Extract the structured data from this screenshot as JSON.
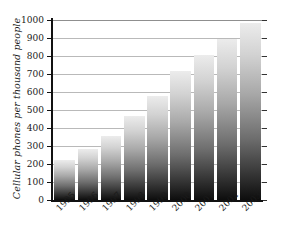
{
  "chart_data": {
    "type": "bar",
    "title": "",
    "subtitle": "",
    "xlabel": "",
    "ylabel": "Cellular phones per thousand people",
    "categories": [
      "1995",
      "1996",
      "1997",
      "1998",
      "1999",
      "2000",
      "2001",
      "2002",
      "2003"
    ],
    "values": [
      225,
      285,
      355,
      465,
      580,
      715,
      805,
      895,
      985
    ],
    "series": [
      {
        "name": "Cellular phones per thousand people",
        "values": [
          225,
          285,
          355,
          465,
          580,
          715,
          805,
          895,
          985
        ]
      }
    ],
    "ylim": [
      0,
      1000
    ],
    "ytick_labels": [
      "1000",
      "900",
      "800",
      "700",
      "600",
      "500",
      "400",
      "300",
      "200",
      "100",
      "0"
    ],
    "ytick_values": [
      1000,
      900,
      800,
      700,
      600,
      500,
      400,
      300,
      200,
      100,
      0
    ],
    "ytick_step": 100,
    "grid": true,
    "grid_axis": "y",
    "legend": false,
    "legend_position": "none",
    "bar_fill": "vertical-gradient-light-top-to-black-bottom",
    "bar_color_top": "#ececec",
    "bar_color_bottom": "#0d0d0d",
    "axis_color": "#111111",
    "gridline_color": "#b9b9b9",
    "background": "#ffffff",
    "annotations": []
  }
}
